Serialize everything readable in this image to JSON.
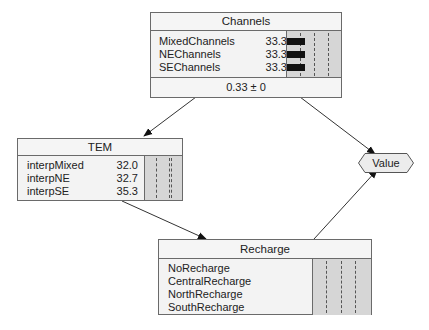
{
  "nodes": {
    "channels": {
      "title": "Channels",
      "states": [
        {
          "label": "MixedChannels",
          "value": "33.3",
          "pct": 33.3
        },
        {
          "label": "NEChannels",
          "value": "33.3",
          "pct": 33.3
        },
        {
          "label": "SEChannels",
          "value": "33.3",
          "pct": 33.3
        }
      ],
      "footer": "0.33 ± 0"
    },
    "tem": {
      "title": "TEM",
      "states": [
        {
          "label": "interpMixed",
          "value": "32.0"
        },
        {
          "label": "interpNE",
          "value": "32.7"
        },
        {
          "label": "interpSE",
          "value": "35.3"
        }
      ]
    },
    "recharge": {
      "title": "Recharge",
      "states": [
        {
          "label": "NoRecharge"
        },
        {
          "label": "CentralRecharge"
        },
        {
          "label": "NorthRecharge"
        },
        {
          "label": "SouthRecharge"
        }
      ]
    },
    "value": {
      "label": "Value"
    }
  },
  "edges": [
    {
      "from": "Channels",
      "to": "TEM"
    },
    {
      "from": "Channels",
      "to": "Value"
    },
    {
      "from": "TEM",
      "to": "Recharge"
    },
    {
      "from": "Recharge",
      "to": "Value"
    }
  ]
}
